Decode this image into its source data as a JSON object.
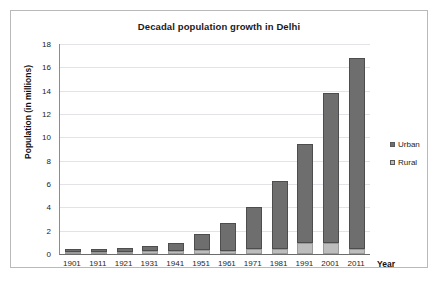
{
  "chart_data": {
    "type": "bar",
    "subtype": "stacked-column",
    "title": "Decadal population growth in Delhi",
    "xlabel": "Year",
    "ylabel": "Population (in millions)",
    "ylim": [
      0,
      18
    ],
    "ytick_step": 2,
    "yticks": [
      0,
      2,
      4,
      6,
      8,
      10,
      12,
      14,
      16,
      18
    ],
    "grid": true,
    "grid_axis": "y",
    "legend_position": "right",
    "categories": [
      "1901",
      "1911",
      "1921",
      "1931",
      "1941",
      "1951",
      "1961",
      "1971",
      "1981",
      "1991",
      "2001",
      "2011"
    ],
    "series": [
      {
        "name": "Rural",
        "color": "#bdbdbd",
        "values": [
          0.17,
          0.19,
          0.2,
          0.24,
          0.3,
          0.31,
          0.3,
          0.42,
          0.45,
          0.95,
          0.94,
          0.42
        ]
      },
      {
        "name": "Urban",
        "color": "#6e6e6e",
        "values": [
          0.23,
          0.22,
          0.3,
          0.42,
          0.62,
          1.44,
          2.36,
          3.65,
          5.77,
          8.47,
          12.9,
          16.37
        ]
      }
    ],
    "totals": [
      0.4,
      0.41,
      0.5,
      0.66,
      0.92,
      1.75,
      2.66,
      4.07,
      6.22,
      9.42,
      13.84,
      16.79
    ]
  },
  "legend": {
    "items": [
      {
        "label": "Urban",
        "color": "#6e6e6e"
      },
      {
        "label": "Rural",
        "color": "#bdbdbd"
      }
    ]
  }
}
